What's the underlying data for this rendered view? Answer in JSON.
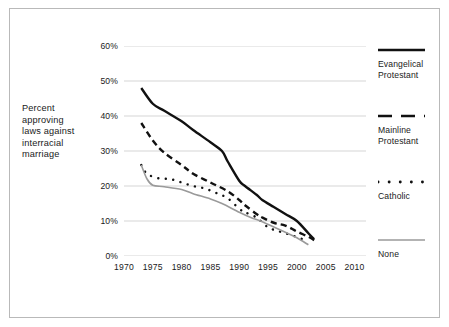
{
  "figure": {
    "background_color": "#ffffff",
    "border_color": "#b9b9b9",
    "axis_label_lines": [
      "Percent",
      "approving",
      "laws against",
      "interracial",
      "marriage"
    ]
  },
  "chart_data": {
    "type": "line",
    "title": "",
    "subtitle": "",
    "xlabel": "",
    "ylabel": "Percent approving laws against interracial marriage",
    "xlim": [
      1970,
      2012
    ],
    "ylim": [
      0,
      60
    ],
    "xticks": [
      "1970",
      "1975",
      "1980",
      "1985",
      "1990",
      "1995",
      "2000",
      "2005",
      "2010"
    ],
    "xtick_values": [
      1970,
      1975,
      1980,
      1985,
      1990,
      1995,
      2000,
      2005,
      2010
    ],
    "yticks": [
      "0%",
      "10%",
      "20%",
      "30%",
      "40%",
      "50%",
      "60%"
    ],
    "ytick_values": [
      0,
      10,
      20,
      30,
      40,
      50,
      60
    ],
    "grid": "horizontal",
    "grid_color": "#d5d5d5",
    "legend_position": "right",
    "series": [
      {
        "name": "Evangelical Protestant",
        "style": "solid",
        "color": "#111111",
        "width": 2.4,
        "x": [
          1973,
          1975,
          1977,
          1980,
          1982,
          1985,
          1987,
          1988,
          1990,
          1991,
          1993,
          1994,
          1996,
          1998,
          2000,
          2002,
          2003
        ],
        "values": [
          48.0,
          43.5,
          41.5,
          38.5,
          36.0,
          32.5,
          30.0,
          27.0,
          21.5,
          20.0,
          17.5,
          16.0,
          14.0,
          12.0,
          10.0,
          6.5,
          4.8
        ]
      },
      {
        "name": "Mainline Protestant",
        "style": "dashed",
        "color": "#111111",
        "width": 2.4,
        "x": [
          1973,
          1975,
          1977,
          1980,
          1982,
          1985,
          1988,
          1990,
          1991,
          1993,
          1994,
          1996,
          1998,
          2000,
          2002,
          2003
        ],
        "values": [
          38.0,
          33.0,
          29.5,
          26.0,
          23.5,
          21.0,
          18.5,
          16.0,
          14.5,
          12.0,
          11.0,
          9.5,
          8.7,
          7.0,
          5.5,
          4.5
        ]
      },
      {
        "name": "Catholic",
        "style": "dotted",
        "color": "#111111",
        "width": 2.4,
        "x": [
          1973,
          1974,
          1976,
          1978,
          1980,
          1982,
          1984,
          1986,
          1988,
          1990,
          1991,
          1993,
          1995,
          1997,
          1999,
          2001,
          2002
        ],
        "values": [
          26.0,
          23.5,
          22.2,
          22.0,
          21.0,
          20.0,
          19.3,
          18.0,
          16.5,
          13.5,
          12.5,
          11.0,
          8.2,
          7.0,
          6.0,
          4.8,
          4.3
        ]
      },
      {
        "name": "None",
        "style": "solid-thin",
        "color": "#9a9a9a",
        "width": 1.6,
        "x": [
          1973,
          1974,
          1975,
          1977,
          1980,
          1982,
          1985,
          1987,
          1990,
          1992,
          1994,
          1996,
          1998,
          2000,
          2002
        ],
        "values": [
          26.0,
          22.0,
          20.2,
          19.8,
          19.0,
          17.8,
          16.3,
          15.0,
          12.5,
          11.0,
          9.8,
          8.3,
          6.8,
          5.2,
          3.2
        ]
      }
    ]
  },
  "legend": {
    "items": [
      {
        "label_line1": "Evangelical",
        "label_line2": "Protestant",
        "style": "solid",
        "color": "#111111"
      },
      {
        "label_line1": "Mainline",
        "label_line2": "Protestant",
        "style": "dashed",
        "color": "#111111"
      },
      {
        "label_line1": "Catholic",
        "label_line2": "",
        "style": "dotted",
        "color": "#111111"
      },
      {
        "label_line1": "None",
        "label_line2": "",
        "style": "solid-thin",
        "color": "#9a9a9a"
      }
    ]
  }
}
